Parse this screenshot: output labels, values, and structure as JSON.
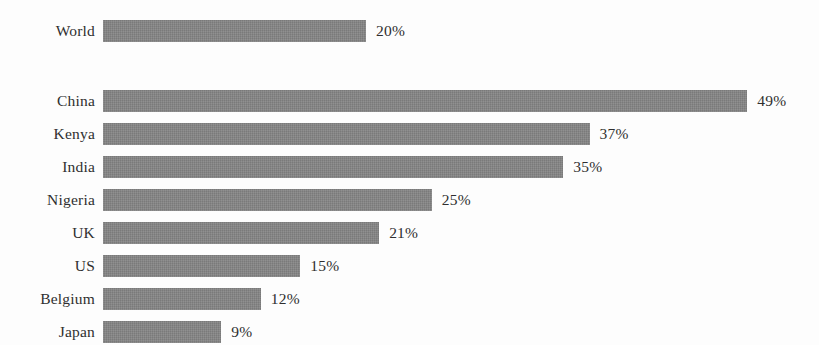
{
  "chart_data": {
    "type": "bar",
    "orientation": "horizontal",
    "title": "",
    "subtitle": "",
    "xlabel": "",
    "ylabel": "",
    "grid": false,
    "legend": null,
    "axis_visible": false,
    "value_suffix": "%",
    "xlim": [
      0,
      49
    ],
    "categories": [
      "World",
      "China",
      "Kenya",
      "India",
      "Nigeria",
      "UK",
      "US",
      "Belgium",
      "Japan"
    ],
    "values": [
      20,
      49,
      37,
      35,
      25,
      21,
      15,
      12,
      9
    ],
    "value_labels": [
      "20%",
      "49%",
      "37%",
      "35%",
      "25%",
      "21%",
      "15%",
      "12%",
      "9%"
    ],
    "bar_color": "#848484",
    "background_color": "#fdfdfd",
    "text_color": "#2f2f2f",
    "bars": [
      {
        "category": "World",
        "value": 20,
        "label": "20%",
        "group": "aggregate"
      },
      {
        "category": "China",
        "value": 49,
        "label": "49%",
        "group": "country"
      },
      {
        "category": "Kenya",
        "value": 37,
        "label": "37%",
        "group": "country"
      },
      {
        "category": "India",
        "value": 35,
        "label": "35%",
        "group": "country"
      },
      {
        "category": "Nigeria",
        "value": 25,
        "label": "25%",
        "group": "country"
      },
      {
        "category": "UK",
        "value": 21,
        "label": "21%",
        "group": "country"
      },
      {
        "category": "US",
        "value": 15,
        "label": "15%",
        "group": "country"
      },
      {
        "category": "Belgium",
        "value": 12,
        "label": "12%",
        "group": "country"
      },
      {
        "category": "Japan",
        "value": 9,
        "label": "9%",
        "group": "country"
      }
    ]
  },
  "layout": {
    "bar_start_x": 103,
    "px_per_unit": 13.15,
    "bar_height": 22,
    "row_pitch": 33,
    "first_row_top": 20,
    "group_gap": 37,
    "label_right_edge": 95,
    "value_label_offset": 10
  }
}
